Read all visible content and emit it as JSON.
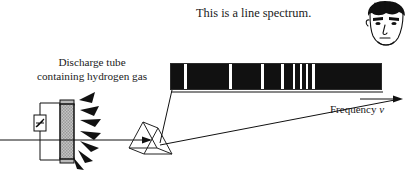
{
  "figure": {
    "title_text": "This is a line spectrum.",
    "source_label": {
      "line1": "Discharge tube",
      "line2": "containing hydrogen gas"
    },
    "axis_label": {
      "text": "Frequency",
      "symbol": "ν"
    }
  },
  "spectrum": {
    "type": "line-spectrum",
    "bar": {
      "x": 170,
      "y": 63,
      "width": 212,
      "height": 27,
      "fill_color": "#111111",
      "line_color": "#ffffff"
    },
    "lines": [
      {
        "offset": 13,
        "width": 3
      },
      {
        "offset": 58,
        "width": 3
      },
      {
        "offset": 90,
        "width": 3
      },
      {
        "offset": 110,
        "width": 3
      },
      {
        "offset": 122,
        "width": 2
      },
      {
        "offset": 129,
        "width": 2
      },
      {
        "offset": 135,
        "width": 2
      },
      {
        "offset": 141,
        "width": 3
      }
    ]
  },
  "apparatus": {
    "discharge_tube_name": "discharge-tube",
    "prism_name": "prism",
    "emitted_rays_count": 7,
    "beam_name": "light-beam"
  },
  "observer": {
    "name": "cartoon-face",
    "hair_color": "#111111",
    "skin_color": "#ffffff"
  },
  "colors": {
    "ink": "#111111",
    "paper": "#ffffff",
    "tube_glass": "#b0b0b0"
  }
}
